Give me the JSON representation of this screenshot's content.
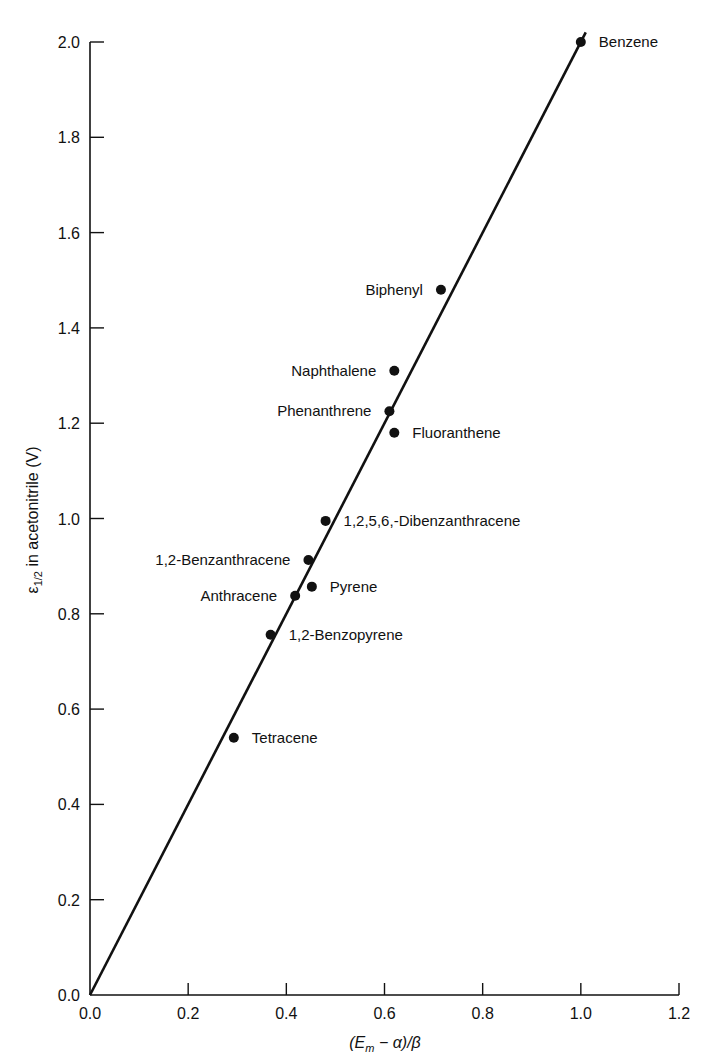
{
  "chart_data": {
    "type": "scatter",
    "title": "",
    "xlabel": "(E_m − α)/β",
    "ylabel": "ε_1/2 in acetonitrile (V)",
    "xlim": [
      0.0,
      1.2
    ],
    "ylim": [
      0.0,
      2.0
    ],
    "x_ticks": [
      "0.0",
      "0.2",
      "0.4",
      "0.6",
      "0.8",
      "1.0",
      "1.2"
    ],
    "y_ticks": [
      "0.0",
      "0.2",
      "0.4",
      "0.6",
      "0.8",
      "1.0",
      "1.2",
      "1.4",
      "1.6",
      "1.8",
      "2.0"
    ],
    "grid": false,
    "legend": null,
    "points": [
      {
        "label": "Benzene",
        "x": 1.0,
        "y": 2.0,
        "label_side": "right"
      },
      {
        "label": "Biphenyl",
        "x": 0.715,
        "y": 1.48,
        "label_side": "left"
      },
      {
        "label": "Naphthalene",
        "x": 0.62,
        "y": 1.31,
        "label_side": "left"
      },
      {
        "label": "Phenanthrene",
        "x": 0.61,
        "y": 1.225,
        "label_side": "left"
      },
      {
        "label": "Fluoranthene",
        "x": 0.62,
        "y": 1.18,
        "label_side": "right"
      },
      {
        "label": "1,2,5,6,-Dibenzanthracene",
        "x": 0.48,
        "y": 0.995,
        "label_side": "right"
      },
      {
        "label": "1,2-Benzanthracene",
        "x": 0.445,
        "y": 0.913,
        "label_side": "left"
      },
      {
        "label": "Pyrene",
        "x": 0.452,
        "y": 0.857,
        "label_side": "right"
      },
      {
        "label": "Anthracene",
        "x": 0.418,
        "y": 0.838,
        "label_side": "left"
      },
      {
        "label": "1,2-Benzopyrene",
        "x": 0.368,
        "y": 0.756,
        "label_side": "right"
      },
      {
        "label": "Tetracene",
        "x": 0.293,
        "y": 0.54,
        "label_side": "right"
      }
    ],
    "fit_line": {
      "x0": 0.0,
      "y0": 0.0,
      "x1": 1.01,
      "y1": 2.02,
      "slope": 2.0
    }
  },
  "axes": {
    "xlabel_main": "(E",
    "xlabel_sub": "m",
    "xlabel_rest": " − α)/β",
    "ylabel_main": "ε",
    "ylabel_sub": "1/2",
    "ylabel_rest": " in acetonitrile (V)"
  }
}
